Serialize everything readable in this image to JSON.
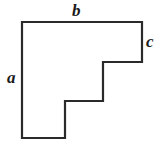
{
  "diagram": {
    "type": "staircase-polygon",
    "stroke_color": "#2a2a2a",
    "fill_color": "#ffffff",
    "labels": {
      "a": "a",
      "b": "b",
      "c": "c"
    },
    "label_meaning": {
      "a": "left side height",
      "b": "top side width",
      "c": "right step height"
    },
    "vertices": [
      [
        22,
        22
      ],
      [
        142,
        22
      ],
      [
        142,
        62
      ],
      [
        103,
        62
      ],
      [
        103,
        101
      ],
      [
        65,
        101
      ],
      [
        65,
        138
      ],
      [
        22,
        138
      ]
    ]
  }
}
